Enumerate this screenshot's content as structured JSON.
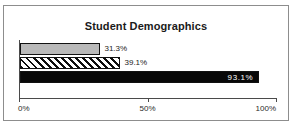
{
  "chart_data": {
    "type": "bar",
    "orientation": "horizontal",
    "title": "Student Demographics",
    "xlabel": "",
    "ylabel": "",
    "xlim": [
      0,
      100
    ],
    "grid": false,
    "legend": "none",
    "x_tick_labels": [
      "0%",
      "50%",
      "100%"
    ],
    "x_tick_values": [
      0,
      50,
      100
    ],
    "categories": [
      "series-1",
      "series-2",
      "series-3"
    ],
    "values": [
      31.3,
      39.1,
      93.1
    ],
    "data_labels": [
      "31.3%",
      "39.1%",
      "93.1%"
    ],
    "bars": [
      {
        "value": 31.3,
        "label": "31.3%",
        "fill": "light-gray",
        "label_position": "outside",
        "color": "#b9b9b9"
      },
      {
        "value": 39.1,
        "label": "39.1%",
        "fill": "diagonal-hatch",
        "label_position": "outside",
        "color": "#ffffff"
      },
      {
        "value": 93.1,
        "label": "93.1%",
        "fill": "solid-black",
        "label_position": "inside",
        "color": "#080808"
      }
    ]
  },
  "colors": {
    "frame_border": "#8d8d8d",
    "axis": "#4a4a4a",
    "bar_outline": "#111111",
    "title_text": "#1a1a1a",
    "label_text": "#1b1b1b",
    "inside_label_text": "#ffffff",
    "background": "#ffffff"
  }
}
